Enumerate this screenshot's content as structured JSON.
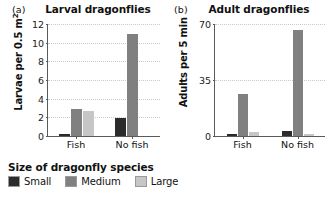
{
  "chart_data": [
    {
      "type": "bar",
      "panel_tag": "(a)",
      "title": "Larval dragonflies",
      "xlabel": "",
      "ylabel": "Larvae per 0.5 m",
      "ylabel_sup": "2",
      "categories": [
        "Fish",
        "No fish"
      ],
      "yticks": [
        0,
        2,
        4,
        6,
        8,
        10,
        12
      ],
      "ylim": [
        0,
        12
      ],
      "grid": true,
      "series": [
        {
          "name": "Small",
          "color": "#2b2b2b",
          "values": [
            0.2,
            1.9
          ]
        },
        {
          "name": "Medium",
          "color": "#808080",
          "values": [
            2.9,
            10.9
          ]
        },
        {
          "name": "Large",
          "color": "#c6c6c6",
          "values": [
            2.7,
            0.0
          ]
        }
      ]
    },
    {
      "type": "bar",
      "panel_tag": "(b)",
      "title": "Adult dragonflies",
      "xlabel": "",
      "ylabel": "Adults per 5 min",
      "ylabel_sup": "",
      "categories": [
        "Fish",
        "No fish"
      ],
      "yticks": [
        0,
        35,
        70
      ],
      "ylim": [
        0,
        70
      ],
      "grid": true,
      "series": [
        {
          "name": "Small",
          "color": "#2b2b2b",
          "values": [
            1.0,
            3.0
          ]
        },
        {
          "name": "Medium",
          "color": "#808080",
          "values": [
            26.5,
            66.0
          ]
        },
        {
          "name": "Large",
          "color": "#c6c6c6",
          "values": [
            2.2,
            1.0
          ]
        }
      ]
    }
  ],
  "legend": {
    "title": "Size of dragonfly species",
    "items": [
      {
        "label": "Small",
        "color": "#2b2b2b"
      },
      {
        "label": "Medium",
        "color": "#808080"
      },
      {
        "label": "Large",
        "color": "#c6c6c6"
      }
    ]
  }
}
